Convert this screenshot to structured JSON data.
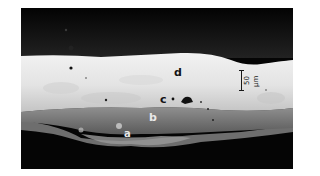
{
  "image": {
    "description": "Grayscale micrograph of a layered cross-section",
    "layers": [
      {
        "id": "a",
        "label": "a",
        "color": "#7a7a7a"
      },
      {
        "id": "b",
        "label": "b",
        "color": "#8c8c8c"
      },
      {
        "id": "c",
        "label": "c",
        "color": "#1a1a1a"
      },
      {
        "id": "d",
        "label": "d",
        "color": "#e6e6e6"
      }
    ],
    "scale_bar": {
      "label": "50 µm"
    },
    "colors": {
      "background": "#050505",
      "top_layer": "#e6e6e6",
      "mid_layer": "#bdbdbd",
      "lower_layer": "#7d7d7d",
      "substrate": "#050505"
    }
  }
}
